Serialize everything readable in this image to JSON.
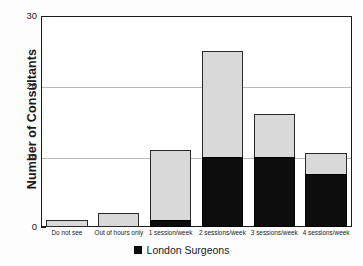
{
  "chart_data": {
    "type": "bar",
    "stacked": true,
    "title": "",
    "xlabel": "",
    "ylabel": "Number of Consultants",
    "ylim": [
      0,
      30
    ],
    "yticks": [
      0,
      10,
      20,
      30
    ],
    "yticks_minor": [
      5,
      15,
      25
    ],
    "grid": "horizontal",
    "legend_position": "bottom-center",
    "categories": [
      "Do not see",
      "Out of hours only",
      "1 session/week",
      "2 sessions/week",
      "3 sessions/week",
      "4 sessions/week"
    ],
    "series": [
      {
        "name": "London Surgeons",
        "color": "#0d0d0d",
        "values": [
          0,
          0,
          1,
          10,
          10,
          7.5
        ]
      },
      {
        "name": "All Consultants (total)",
        "color": "#d9d9d9",
        "values": [
          1,
          2,
          11,
          25,
          16,
          10.5
        ]
      }
    ],
    "legend": [
      {
        "label": "London Surgeons",
        "color": "#0d0d0d"
      }
    ]
  },
  "axis": {
    "y_title": "Number of Consultants",
    "y_tick_labels": [
      "0",
      "10",
      "20",
      "30"
    ]
  },
  "legend": {
    "items": [
      {
        "label": "London Surgeons"
      }
    ]
  },
  "colors": {
    "bar_total": "#d9d9d9",
    "bar_london": "#0d0d0d",
    "frame": "#1b1b1b",
    "grid": "#b9b9b9",
    "background": "#fdfdfd"
  }
}
